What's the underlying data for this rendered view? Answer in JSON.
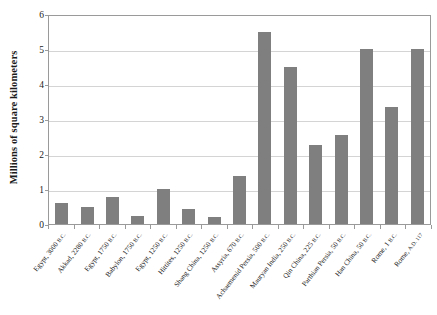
{
  "chart_data": {
    "type": "bar",
    "title": "",
    "xlabel": "",
    "ylabel": "Millions of square kilometers",
    "ylim": [
      0,
      6
    ],
    "ytick_labels": [
      "0",
      "1",
      "2",
      "3",
      "4",
      "5",
      "6"
    ],
    "ytick_values": [
      0,
      1,
      2,
      3,
      4,
      5,
      6
    ],
    "grid": true,
    "legend": "none",
    "bar_color": "#7f7f7f",
    "categories": [
      "Egypt, 3000 B.C.",
      "Akkad, 2280 B.C.",
      "Egypt, 1750 B.C.",
      "Babylon, 1750 B.C.",
      "Egypt, 1250 B.C.",
      "Hittites, 1250 B.C.",
      "Shang China, 1250 B.C.",
      "Assyria, 670 B.C.",
      "Achaemenid Persia, 500 B.C.",
      "Mauryan India, 250 B.C.",
      "Qin China, 225 B.C.",
      "Parthian Persia, 50 B.C.",
      "Han China, 50 B.C.",
      "Rome, 1 B.C.",
      "Rome, A.D. 117"
    ],
    "values": [
      0.6,
      0.5,
      0.77,
      0.23,
      1.0,
      0.42,
      0.2,
      1.38,
      5.5,
      4.5,
      2.27,
      2.55,
      5.0,
      3.35,
      5.0
    ]
  }
}
